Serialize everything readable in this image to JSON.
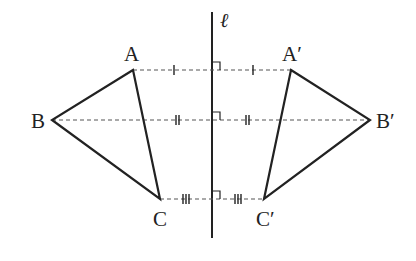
{
  "diagram": {
    "axis_label": "ℓ",
    "colors": {
      "stroke": "#222222",
      "dashed": "#555555",
      "background": "#ffffff"
    },
    "points": {
      "A": {
        "label": "A",
        "x": 133,
        "y": 70
      },
      "B": {
        "label": "B",
        "x": 52,
        "y": 120
      },
      "C": {
        "label": "C",
        "x": 160,
        "y": 199
      },
      "A2": {
        "label": "A′",
        "x": 291,
        "y": 70
      },
      "B2": {
        "label": "B′",
        "x": 370,
        "y": 120
      },
      "C2": {
        "label": "C′",
        "x": 264,
        "y": 199
      }
    },
    "mirror_line": {
      "x": 212,
      "y1": 12,
      "y2": 238
    },
    "tick_marks": {
      "A_row": 1,
      "B_row": 2,
      "C_row": 3
    }
  }
}
